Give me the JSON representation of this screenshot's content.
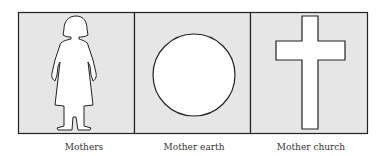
{
  "panels": [
    {
      "icon": "woman-figure-icon",
      "caption": "Mothers"
    },
    {
      "icon": "circle-icon",
      "caption": "Mother earth"
    },
    {
      "icon": "cross-icon",
      "caption": "Mother church"
    }
  ],
  "colors": {
    "panel_fill": "#e6e6e6",
    "stroke": "#222222",
    "shape_fill": "#ffffff"
  }
}
